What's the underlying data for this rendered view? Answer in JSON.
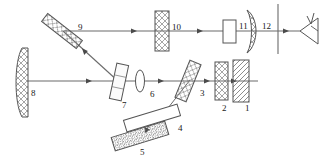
{
  "figure": {
    "type": "optical-system-diagram",
    "style": "line-drawing",
    "background_color": "#ffffff",
    "line_color": "#555555",
    "label_color": "#1a1a1a",
    "hatch_color": "#777777"
  },
  "labels": [
    {
      "id": "1",
      "text": "1",
      "x": 245,
      "y": 104,
      "element": "hatched-plate"
    },
    {
      "id": "2",
      "text": "2",
      "x": 222,
      "y": 104,
      "element": "cross-hatched-plate"
    },
    {
      "id": "3",
      "text": "3",
      "x": 200,
      "y": 89,
      "element": "tilted-beamsplitter"
    },
    {
      "id": "4",
      "text": "4",
      "x": 178,
      "y": 124,
      "element": "tilted-plate-plain"
    },
    {
      "id": "5",
      "text": "5",
      "x": 140,
      "y": 148,
      "element": "tilted-hatched-plate"
    },
    {
      "id": "6",
      "text": "6",
      "x": 150,
      "y": 90,
      "element": "biconvex-lens"
    },
    {
      "id": "7",
      "text": "7",
      "x": 122,
      "y": 101,
      "element": "tilted-beamsplitter"
    },
    {
      "id": "8",
      "text": "8",
      "x": 31,
      "y": 89,
      "element": "concave-mirror"
    },
    {
      "id": "9",
      "text": "9",
      "x": 78,
      "y": 23,
      "element": "tilted-mirror"
    },
    {
      "id": "10",
      "text": "10",
      "x": 172,
      "y": 23,
      "element": "hatched-plate"
    },
    {
      "id": "11",
      "text": "11",
      "x": 239,
      "y": 22,
      "element": "plain-plate"
    },
    {
      "id": "12",
      "text": "12",
      "x": 262,
      "y": 22,
      "element": "meniscus-lens"
    }
  ],
  "components": [
    {
      "number": "8",
      "name": "concave-mirror",
      "shape": "curved-hatched-plate",
      "orientation": "vertical",
      "position": "far-left"
    },
    {
      "number": "9",
      "name": "tilted-mirror",
      "shape": "hatched-rectangle",
      "orientation": "tilted-45-ccw",
      "position": "upper-left"
    },
    {
      "number": "7",
      "name": "beamsplitter-lower",
      "shape": "plain-rectangle",
      "orientation": "tilted-slight-ccw",
      "position": "lower-middle-left"
    },
    {
      "number": "6",
      "name": "biconvex-lens",
      "shape": "ellipse",
      "orientation": "vertical",
      "position": "lower-middle"
    },
    {
      "number": "3",
      "name": "beamsplitter-upper",
      "shape": "hatched-rectangle",
      "orientation": "tilted-cw",
      "position": "lower-middle-right"
    },
    {
      "number": "4",
      "name": "tilted-plate",
      "shape": "plain-rectangle",
      "orientation": "tilted-cw",
      "position": "bottom"
    },
    {
      "number": "5",
      "name": "hatched-grating",
      "shape": "hatched-rectangle",
      "orientation": "tilted-cw",
      "position": "bottom"
    },
    {
      "number": "2",
      "name": "cross-hatched-plate",
      "shape": "hatched-rectangle",
      "orientation": "vertical",
      "position": "lower-right"
    },
    {
      "number": "1",
      "name": "diagonal-hatched-plate",
      "shape": "hatched-rectangle",
      "orientation": "vertical",
      "position": "lower-right"
    },
    {
      "number": "10",
      "name": "hatched-plate-upper",
      "shape": "hatched-rectangle",
      "orientation": "vertical",
      "position": "upper-middle"
    },
    {
      "number": "11",
      "name": "plain-plate-upper",
      "shape": "plain-rectangle",
      "orientation": "vertical",
      "position": "upper-right"
    },
    {
      "number": "12",
      "name": "meniscus-lens",
      "shape": "curved-hatched-lens",
      "orientation": "vertical",
      "position": "upper-right"
    }
  ],
  "beams": [
    {
      "name": "lower-horizontal-beam",
      "from": "8",
      "to": "1",
      "direction": "left-to-right",
      "arrows": 3
    },
    {
      "name": "upper-horizontal-beam",
      "from": "9",
      "to": "eye",
      "direction": "left-to-right",
      "arrows": 3
    },
    {
      "name": "diagonal-beam-7-to-9",
      "from": "7",
      "to": "9",
      "direction": "up-left",
      "arrows": 1
    },
    {
      "name": "diagonal-beam-3-to-4",
      "from": "3",
      "to": "4",
      "direction": "down-left",
      "arrows": 1
    },
    {
      "name": "short-beam-4-to-5",
      "from": "4",
      "to": "5",
      "direction": "down-left",
      "arrows": 1
    }
  ],
  "annotations": {
    "observer": "eye-symbol",
    "image_plane": "vertical-line"
  }
}
